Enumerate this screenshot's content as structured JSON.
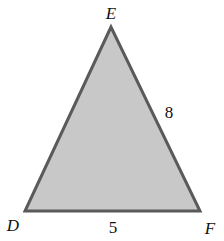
{
  "diagram": {
    "type": "triangle",
    "fill_color": "#c8c8c8",
    "stroke_color": "#5a5a5a",
    "vertices": [
      {
        "name": "E",
        "x": 111,
        "y": 27,
        "label_x": 111,
        "label_y": 19
      },
      {
        "name": "D",
        "x": 25,
        "y": 211,
        "label_x": 13,
        "label_y": 231
      },
      {
        "name": "F",
        "x": 200,
        "y": 211,
        "label_x": 210,
        "label_y": 234
      }
    ],
    "sides": [
      {
        "between": "EF",
        "label": "8",
        "label_x": 169,
        "label_y": 118
      },
      {
        "between": "DF",
        "label": "5",
        "label_x": 113,
        "label_y": 233
      }
    ]
  }
}
